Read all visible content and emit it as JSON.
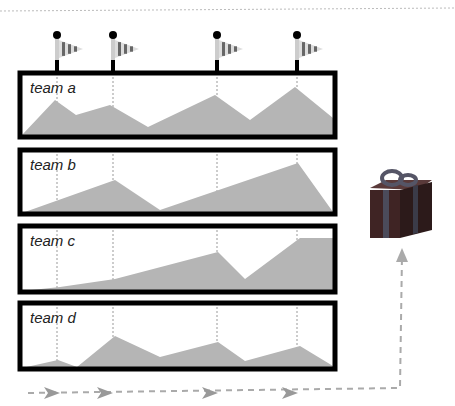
{
  "teams": [
    {
      "label": "team a",
      "box": [
        20,
        73,
        315,
        64
      ],
      "points": [
        [
          22,
          135
        ],
        [
          55,
          100
        ],
        [
          76,
          115
        ],
        [
          110,
          105
        ],
        [
          148,
          127
        ],
        [
          215,
          95
        ],
        [
          250,
          120
        ],
        [
          295,
          87
        ],
        [
          333,
          118
        ],
        [
          333,
          135
        ]
      ]
    },
    {
      "label": "team b",
      "box": [
        20,
        150,
        315,
        64
      ],
      "points": [
        [
          22,
          213
        ],
        [
          115,
          180
        ],
        [
          160,
          210
        ],
        [
          298,
          163
        ],
        [
          333,
          212
        ],
        [
          333,
          213
        ]
      ]
    },
    {
      "label": "team c",
      "box": [
        20,
        226,
        315,
        66
      ],
      "points": [
        [
          22,
          291
        ],
        [
          60,
          287
        ],
        [
          115,
          279
        ],
        [
          218,
          252
        ],
        [
          245,
          279
        ],
        [
          300,
          238
        ],
        [
          333,
          238
        ],
        [
          333,
          291
        ]
      ]
    },
    {
      "label": "team d",
      "box": [
        20,
        303,
        315,
        66
      ],
      "points": [
        [
          22,
          368
        ],
        [
          58,
          360
        ],
        [
          77,
          367
        ],
        [
          115,
          336
        ],
        [
          160,
          357
        ],
        [
          218,
          342
        ],
        [
          245,
          361
        ],
        [
          300,
          346
        ],
        [
          333,
          366
        ],
        [
          333,
          368
        ]
      ]
    }
  ],
  "milestones_x": [
    57,
    113,
    217,
    297
  ],
  "arrow_x": [
    50,
    103,
    208,
    288
  ],
  "colors": {
    "fill": "#b5b5b5",
    "border": "#000000",
    "dash": "#aaaaaa",
    "gift": "#4a3434",
    "ribbon": "#5a5a6a"
  }
}
